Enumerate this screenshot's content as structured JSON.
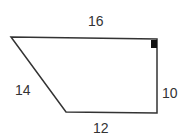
{
  "diagram": {
    "shape": "trapezoid",
    "labels": {
      "top": "16",
      "left": "14",
      "right": "10",
      "bottom": "12"
    },
    "right_angle_marker": "top-right",
    "stroke_color": "#333333"
  }
}
